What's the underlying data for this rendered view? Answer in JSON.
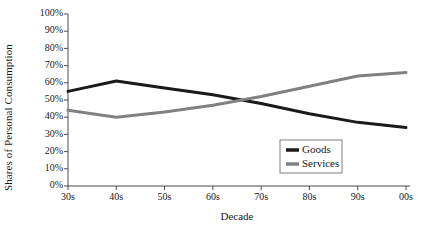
{
  "chart_data": {
    "type": "line",
    "title": "",
    "xlabel": "Decade",
    "ylabel": "Shares of Personal Consumption",
    "categories": [
      "30s",
      "40s",
      "50s",
      "60s",
      "70s",
      "80s",
      "90s",
      "00s"
    ],
    "ylim": [
      0,
      100
    ],
    "ytick_labels": [
      "0%",
      "10%",
      "20%",
      "30%",
      "40%",
      "50%",
      "60%",
      "70%",
      "80%",
      "90%",
      "100%"
    ],
    "ytick_values": [
      0,
      10,
      20,
      30,
      40,
      50,
      60,
      70,
      80,
      90,
      100
    ],
    "grid": false,
    "legend_position": "inside-bottom-right",
    "series": [
      {
        "name": "Goods",
        "color": "#1a1a1a",
        "line_width": 3,
        "values": [
          55,
          61,
          57,
          53,
          48,
          42,
          37,
          34
        ]
      },
      {
        "name": "Services",
        "color": "#808080",
        "line_width": 3,
        "values": [
          44,
          40,
          43,
          47,
          52,
          58,
          64,
          66
        ]
      }
    ]
  },
  "legend": {
    "items": [
      {
        "label": "Goods"
      },
      {
        "label": "Services"
      }
    ]
  }
}
